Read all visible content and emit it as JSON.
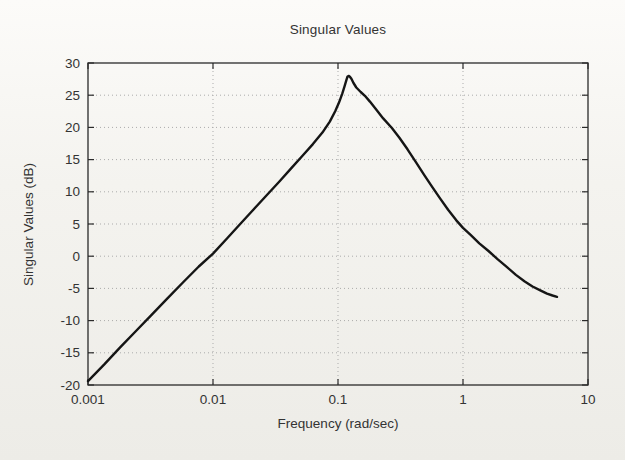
{
  "figure": {
    "background_top": "#fcfbf9",
    "background_bottom": "#edece7"
  },
  "chart_data": {
    "type": "line",
    "title": "Singular Values",
    "xlabel": "Frequency (rad/sec)",
    "ylabel": "Singular Values (dB)",
    "x_scale": "log",
    "xlim": [
      0.001,
      10
    ],
    "ylim": [
      -20,
      30
    ],
    "grid": true,
    "legend": "none",
    "line_color": "#151515",
    "grid_color": "#ababab",
    "axis_color": "#2a2a2a",
    "x_ticks": [
      {
        "value": 0.001,
        "label": "0.001"
      },
      {
        "value": 0.01,
        "label": "0.01"
      },
      {
        "value": 0.1,
        "label": "0.1"
      },
      {
        "value": 1,
        "label": "1"
      },
      {
        "value": 10,
        "label": "10"
      }
    ],
    "y_ticks": [
      {
        "value": 30,
        "label": "30"
      },
      {
        "value": 25,
        "label": "25"
      },
      {
        "value": 20,
        "label": "20"
      },
      {
        "value": 15,
        "label": "15"
      },
      {
        "value": 10,
        "label": "10"
      },
      {
        "value": 5,
        "label": "5"
      },
      {
        "value": 0,
        "label": "0"
      },
      {
        "value": -5,
        "label": "-5"
      },
      {
        "value": -10,
        "label": "-10"
      },
      {
        "value": -15,
        "label": "-15"
      },
      {
        "value": -20,
        "label": "-20"
      }
    ],
    "series": [
      {
        "name": "max-singular-value",
        "peak": {
          "frequency": 0.12,
          "value_db": 28
        },
        "points": [
          [
            0.001,
            -19.4
          ],
          [
            0.00135,
            -16.8
          ],
          [
            0.0018,
            -14.2
          ],
          [
            0.0024,
            -11.7
          ],
          [
            0.0032,
            -9.2
          ],
          [
            0.0043,
            -6.6
          ],
          [
            0.0058,
            -4.0
          ],
          [
            0.0077,
            -1.6
          ],
          [
            0.01,
            0.4
          ],
          [
            0.013,
            2.8
          ],
          [
            0.0165,
            5.0
          ],
          [
            0.021,
            7.2
          ],
          [
            0.027,
            9.5
          ],
          [
            0.034,
            11.6
          ],
          [
            0.042,
            13.6
          ],
          [
            0.052,
            15.6
          ],
          [
            0.063,
            17.4
          ],
          [
            0.075,
            19.2
          ],
          [
            0.086,
            20.9
          ],
          [
            0.095,
            22.5
          ],
          [
            0.102,
            23.9
          ],
          [
            0.108,
            25.2
          ],
          [
            0.113,
            26.4
          ],
          [
            0.1165,
            27.3
          ],
          [
            0.119,
            27.85
          ],
          [
            0.1215,
            28.0
          ],
          [
            0.124,
            27.9
          ],
          [
            0.128,
            27.55
          ],
          [
            0.133,
            26.9
          ],
          [
            0.14,
            26.2
          ],
          [
            0.152,
            25.5
          ],
          [
            0.164,
            24.9
          ],
          [
            0.18,
            24.0
          ],
          [
            0.2,
            22.9
          ],
          [
            0.23,
            21.4
          ],
          [
            0.27,
            19.9
          ],
          [
            0.31,
            18.4
          ],
          [
            0.36,
            16.6
          ],
          [
            0.42,
            14.6
          ],
          [
            0.49,
            12.6
          ],
          [
            0.57,
            10.7
          ],
          [
            0.66,
            8.9
          ],
          [
            0.76,
            7.2
          ],
          [
            0.88,
            5.6
          ],
          [
            1.0,
            4.4
          ],
          [
            1.15,
            3.3
          ],
          [
            1.35,
            2.0
          ],
          [
            1.6,
            0.8
          ],
          [
            1.9,
            -0.5
          ],
          [
            2.25,
            -1.7
          ],
          [
            2.65,
            -2.9
          ],
          [
            3.1,
            -3.9
          ],
          [
            3.6,
            -4.7
          ],
          [
            4.15,
            -5.3
          ],
          [
            4.7,
            -5.8
          ],
          [
            5.2,
            -6.1
          ],
          [
            5.65,
            -6.3
          ]
        ]
      }
    ]
  }
}
